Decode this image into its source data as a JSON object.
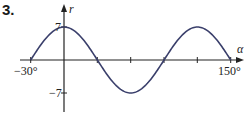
{
  "problem_number": "3.",
  "chart_data": {
    "type": "line",
    "title": "",
    "xlabel": "α",
    "ylabel": "r",
    "function": "r = 7cos(3α)",
    "x": [
      -30,
      -15,
      0,
      15,
      30,
      45,
      60,
      75,
      90,
      105,
      120,
      135,
      150
    ],
    "values": [
      0,
      4.95,
      7,
      4.95,
      0,
      -4.95,
      -7,
      -4.95,
      0,
      4.95,
      7,
      4.95,
      0
    ],
    "xlim": [
      -30,
      150
    ],
    "ylim": [
      -7,
      7
    ],
    "x_tick_labels": [
      "-30°",
      "150°"
    ],
    "x_ticks": [
      -30,
      0,
      30,
      60,
      90,
      120,
      150
    ],
    "y_tick_labels": [
      "7",
      "-7"
    ],
    "grid": false,
    "line_color": "#3a3f6b"
  },
  "labels": {
    "x_axis": "α",
    "y_axis": "r",
    "x_min": "−30°",
    "x_max": "150°",
    "y_max": "7",
    "y_min": "−7"
  }
}
